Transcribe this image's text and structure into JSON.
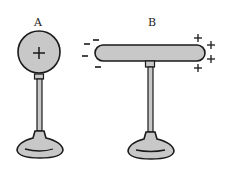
{
  "diagram": {
    "objects": [
      {
        "label": "A",
        "shape": "sphere",
        "charge_symbols": [
          "+"
        ]
      },
      {
        "label": "B",
        "shape": "rod",
        "left_charges": [
          "-",
          "-",
          "-",
          "-"
        ],
        "right_charges": [
          "+",
          "+",
          "+",
          "+"
        ]
      }
    ],
    "colors": {
      "fill": "#c8c8c8",
      "stroke": "#1a1a1a",
      "background": "#ffffff"
    }
  }
}
